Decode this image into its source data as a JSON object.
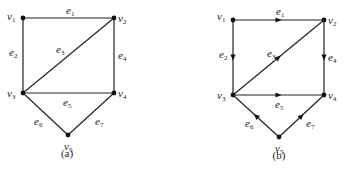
{
  "figure": {
    "graphs": [
      {
        "id": "a",
        "caption": "(a)",
        "directed": false,
        "caption_pos": [
          67,
          157
        ],
        "vertices": [
          {
            "id": "v1",
            "label": "v",
            "sub": "1",
            "x": 23,
            "y": 18,
            "lx": 7,
            "ly": 20
          },
          {
            "id": "v2",
            "label": "v",
            "sub": "2",
            "x": 114,
            "y": 18,
            "lx": 118,
            "ly": 22
          },
          {
            "id": "v3",
            "label": "v",
            "sub": "3",
            "x": 23,
            "y": 93,
            "lx": 7,
            "ly": 97
          },
          {
            "id": "v4",
            "label": "v",
            "sub": "4",
            "x": 114,
            "y": 93,
            "lx": 118,
            "ly": 97
          },
          {
            "id": "v5",
            "label": "v",
            "sub": "5",
            "x": 68,
            "y": 135,
            "lx": 64,
            "ly": 150
          }
        ],
        "edges": [
          {
            "id": "e1",
            "label": "e",
            "sub": "1",
            "from": "v1",
            "to": "v2",
            "lx": 66,
            "ly": 14
          },
          {
            "id": "e2",
            "label": "e",
            "sub": "2",
            "from": "v1",
            "to": "v3",
            "lx": 9,
            "ly": 56
          },
          {
            "id": "e3",
            "label": "e",
            "sub": "3",
            "from": "v3",
            "to": "v2",
            "lx": 56,
            "ly": 53
          },
          {
            "id": "e4",
            "label": "e",
            "sub": "4",
            "from": "v2",
            "to": "v4",
            "lx": 118,
            "ly": 59
          },
          {
            "id": "e5",
            "label": "e",
            "sub": "5",
            "from": "v3",
            "to": "v4",
            "lx": 63,
            "ly": 106
          },
          {
            "id": "e6",
            "label": "e",
            "sub": "6",
            "from": "v3",
            "to": "v5",
            "lx": 34,
            "ly": 125
          },
          {
            "id": "e7",
            "label": "e",
            "sub": "7",
            "from": "v5",
            "to": "v4",
            "lx": 95,
            "ly": 125
          }
        ]
      },
      {
        "id": "b",
        "caption": "(b)",
        "directed": true,
        "caption_pos": [
          279,
          159
        ],
        "vertices": [
          {
            "id": "v1",
            "label": "v",
            "sub": "1",
            "x": 233,
            "y": 20,
            "lx": 217,
            "ly": 20
          },
          {
            "id": "v2",
            "label": "v",
            "sub": "2",
            "x": 324,
            "y": 20,
            "lx": 328,
            "ly": 24
          },
          {
            "id": "v3",
            "label": "v",
            "sub": "3",
            "x": 233,
            "y": 95,
            "lx": 217,
            "ly": 99
          },
          {
            "id": "v4",
            "label": "v",
            "sub": "4",
            "x": 324,
            "y": 95,
            "lx": 328,
            "ly": 99
          },
          {
            "id": "v5",
            "label": "v",
            "sub": "5",
            "x": 279,
            "y": 137,
            "lx": 275,
            "ly": 152
          }
        ],
        "edges": [
          {
            "id": "e1",
            "label": "e",
            "sub": "1",
            "from": "v1",
            "to": "v2",
            "lx": 276,
            "ly": 15
          },
          {
            "id": "e2",
            "label": "e",
            "sub": "2",
            "from": "v1",
            "to": "v3",
            "lx": 219,
            "ly": 58
          },
          {
            "id": "e3",
            "label": "e",
            "sub": "3",
            "from": "v3",
            "to": "v2",
            "lx": 267,
            "ly": 57
          },
          {
            "id": "e4",
            "label": "e",
            "sub": "4",
            "from": "v2",
            "to": "v4",
            "lx": 328,
            "ly": 61
          },
          {
            "id": "e5",
            "label": "e",
            "sub": "5",
            "from": "v3",
            "to": "v4",
            "lx": 275,
            "ly": 108
          },
          {
            "id": "e6",
            "label": "e",
            "sub": "6",
            "from": "v5",
            "to": "v3",
            "lx": 245,
            "ly": 127
          },
          {
            "id": "e7",
            "label": "e",
            "sub": "7",
            "from": "v5",
            "to": "v4",
            "lx": 306,
            "ly": 127
          }
        ]
      }
    ]
  }
}
